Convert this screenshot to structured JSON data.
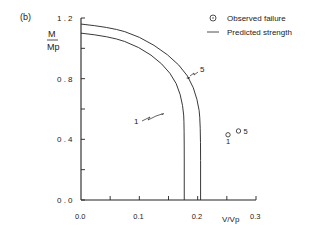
{
  "panel_label": "(b)",
  "legend": {
    "observed": "Observed  failure",
    "predicted": "Predicted strength"
  },
  "chart_data": {
    "type": "line",
    "title": "",
    "xlabel": "V/Vp",
    "ylabel_num": "M",
    "ylabel_den": "Mp",
    "xlim": [
      0.0,
      0.3
    ],
    "ylim": [
      0.0,
      1.2
    ],
    "x_ticks": [
      "0.0",
      "0.1",
      "0.2",
      "0.3"
    ],
    "y_ticks": [
      "0.0",
      "0.4",
      "0.8",
      "1.2"
    ],
    "grid": false,
    "legend_position": "top-right",
    "series": [
      {
        "name": "Predicted strength (1)",
        "label": "1",
        "points": [
          [
            0.0,
            1.1
          ],
          [
            0.05,
            1.08
          ],
          [
            0.1,
            1.01
          ],
          [
            0.14,
            0.9
          ],
          [
            0.165,
            0.77
          ],
          [
            0.175,
            0.62
          ],
          [
            0.177,
            0.5
          ],
          [
            0.177,
            0.0
          ]
        ]
      },
      {
        "name": "Predicted strength (5)",
        "label": "5",
        "points": [
          [
            0.0,
            1.16
          ],
          [
            0.05,
            1.14
          ],
          [
            0.1,
            1.08
          ],
          [
            0.15,
            0.96
          ],
          [
            0.185,
            0.82
          ],
          [
            0.2,
            0.66
          ],
          [
            0.205,
            0.52
          ],
          [
            0.205,
            0.0
          ]
        ]
      }
    ],
    "observed_failures": [
      {
        "label": "1",
        "x": 0.252,
        "y": 0.43
      },
      {
        "label": "5",
        "x": 0.27,
        "y": 0.455
      }
    ]
  }
}
